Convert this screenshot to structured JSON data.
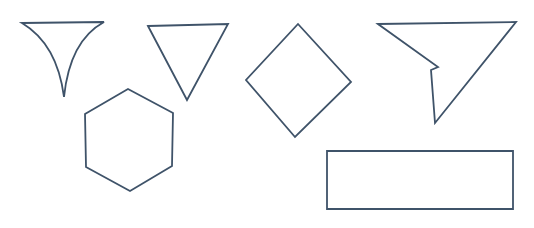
{
  "canvas": {
    "width": 534,
    "height": 228,
    "background_color": "#ffffff",
    "stroke_color": "#3f5369",
    "stroke_width": 1.8,
    "fill": "none",
    "description": "Line drawing of six outlined geometric shapes on a plain white background"
  },
  "shapes": [
    {
      "id": "shape-1",
      "name": "concave-funnel-triangle",
      "label": "Funnel (concave-sided inverted triangle)",
      "sides": 3,
      "curved": true,
      "bounds": {
        "x": 22,
        "y": 22,
        "width": 82,
        "height": 75
      },
      "vertices": [
        {
          "x": 22,
          "y": 23
        },
        {
          "x": 104,
          "y": 22
        },
        {
          "x": 63,
          "y": 97
        }
      ],
      "path": "M22,23 L104,22 C82,34 68,58 64,97 C59,58 42,35 22,23 Z"
    },
    {
      "id": "shape-2",
      "name": "inverted-triangle",
      "label": "Inverted triangle",
      "sides": 3,
      "curved": false,
      "bounds": {
        "x": 148,
        "y": 24,
        "width": 80,
        "height": 76
      },
      "vertices": [
        {
          "x": 148,
          "y": 26
        },
        {
          "x": 228,
          "y": 24
        },
        {
          "x": 187,
          "y": 100
        }
      ],
      "path": "M148,26 L228,24 L187,100 Z"
    },
    {
      "id": "shape-3",
      "name": "hexagon",
      "label": "Regular hexagon",
      "sides": 6,
      "curved": false,
      "bounds": {
        "x": 85,
        "y": 89,
        "width": 89,
        "height": 102
      },
      "vertices": [
        {
          "x": 128,
          "y": 89
        },
        {
          "x": 173,
          "y": 113
        },
        {
          "x": 172,
          "y": 166
        },
        {
          "x": 130,
          "y": 191
        },
        {
          "x": 86,
          "y": 167
        },
        {
          "x": 85,
          "y": 114
        }
      ],
      "path": "M128,89 L173,113 L172,166 L130,191 L86,167 L85,114 Z"
    },
    {
      "id": "shape-4",
      "name": "diamond",
      "label": "Diamond (rotated square)",
      "sides": 4,
      "curved": false,
      "bounds": {
        "x": 246,
        "y": 24,
        "width": 105,
        "height": 113
      },
      "vertices": [
        {
          "x": 298,
          "y": 24
        },
        {
          "x": 351,
          "y": 82
        },
        {
          "x": 295,
          "y": 137
        },
        {
          "x": 246,
          "y": 80
        }
      ],
      "path": "M298,24 L351,82 L295,137 L246,80 Z"
    },
    {
      "id": "shape-5",
      "name": "concave-notched-triangle",
      "label": "Notched (concave) inverted triangle",
      "sides": 5,
      "curved": false,
      "bounds": {
        "x": 378,
        "y": 22,
        "width": 138,
        "height": 101
      },
      "vertices": [
        {
          "x": 378,
          "y": 24
        },
        {
          "x": 516,
          "y": 22
        },
        {
          "x": 435,
          "y": 123
        },
        {
          "x": 431,
          "y": 70
        },
        {
          "x": 438,
          "y": 67
        }
      ],
      "path": "M378,24 L516,22 L435,123 L431,70 L438,67 Z"
    },
    {
      "id": "shape-6",
      "name": "rectangle",
      "label": "Rectangle",
      "sides": 4,
      "curved": false,
      "bounds": {
        "x": 327,
        "y": 151,
        "width": 186,
        "height": 58
      },
      "vertices": [
        {
          "x": 327,
          "y": 151
        },
        {
          "x": 513,
          "y": 151
        },
        {
          "x": 513,
          "y": 209
        },
        {
          "x": 327,
          "y": 209
        }
      ],
      "path": "M327,151 L513,151 L513,209 L327,209 Z"
    }
  ]
}
